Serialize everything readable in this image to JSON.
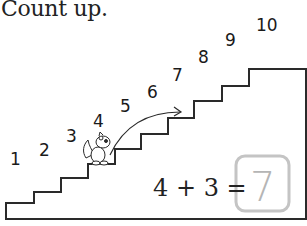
{
  "title": "Count up.",
  "numbers": [
    "1",
    "2",
    "3",
    "4",
    "5",
    "6",
    "7",
    "8",
    "9",
    "10"
  ],
  "equation": {
    "text": "4 + 3 =",
    "answer": "7"
  },
  "colors": {
    "line": "#2a2a2a",
    "answer_box": "#c4c4c4"
  },
  "icons": {
    "character": "squirrel-icon",
    "arrow": "curved-arrow-icon"
  }
}
